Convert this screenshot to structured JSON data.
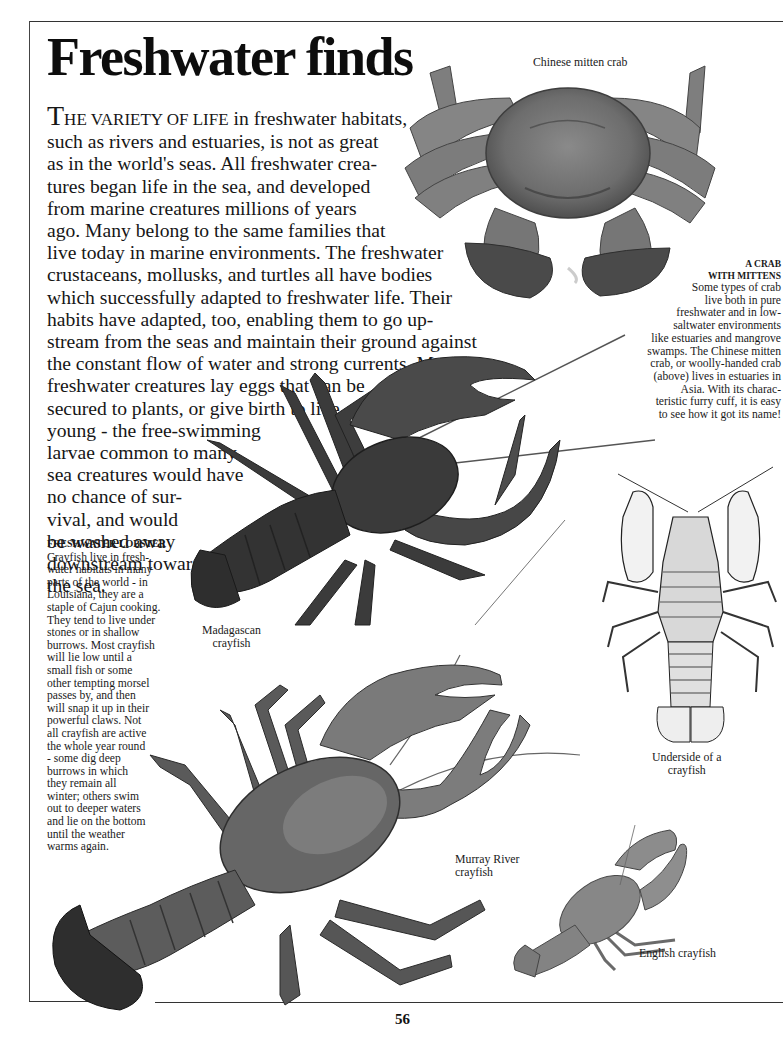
{
  "page": {
    "title": "Freshwater finds",
    "page_number": "56"
  },
  "intro": {
    "dropcap": "T",
    "smallcaps_lead": "HE VARIETY OF LIFE",
    "lines": [
      " in freshwater habitats,",
      "such as rivers and estuaries, is not as great",
      "as in the world's seas. All freshwater crea-",
      "tures began life in the sea, and developed",
      "from marine creatures millions of years",
      "ago.  Many belong to the same families that",
      "live today in marine environments. The freshwater",
      "crustaceans, mollusks, and turtles all have bodies",
      "which successfully adapted to freshwater life. Their",
      "habits have adapted, too, enabling them to go up-",
      "stream from the seas and maintain their ground against",
      "the constant flow of water and strong currents. Many",
      "freshwater creatures lay eggs that can be",
      "secured to plants, or give birth to live",
      "young - the  free-swimming",
      "larvae common to many",
      "sea creatures would have",
      "no chance of sur-",
      "vival, and would",
      "be washed away",
      "downstream toward",
      "the sea."
    ]
  },
  "sidebar_caption": {
    "heading": "FRESHWATER LOBSTER",
    "lines": [
      "Crayfish live in fresh-",
      "water habitats in many",
      "parts of the world - in",
      "Louisiana, they are a",
      "staple of Cajun cooking.",
      "They tend to live under",
      "stones or in shallow",
      "burrows.  Most crayfish",
      "will lie low until a",
      "small fish or some",
      "other tempting morsel",
      "passes by,  and then",
      "will snap it up in their",
      "powerful claws. Not",
      "all crayfish are active",
      "the whole year round",
      "- some dig deep",
      "burrows in which",
      "they remain all",
      "winter; others swim",
      "out to deeper waters",
      "and lie on the bottom",
      "until the weather",
      "warms again."
    ]
  },
  "crab_caption": {
    "heading_lines": [
      "A CRAB",
      "WITH MITTENS"
    ],
    "lines": [
      "Some types of crab",
      "live both in pure",
      "freshwater and in low-",
      "saltwater environments",
      "like estuaries and mangrove",
      "swamps.  The Chinese mitten",
      "crab, or woolly-handed crab",
      "(above) lives in estuaries in",
      "Asia.  With its charac-",
      "teristic furry cuff, it is easy",
      "to see how it got its name!"
    ]
  },
  "figures": {
    "chinese_mitten_crab": {
      "label": "Chinese mitten crab"
    },
    "madagascan_crayfish": {
      "label_lines": [
        "Madagascan",
        "crayfish"
      ]
    },
    "underside_crayfish": {
      "label_lines": [
        "Underside of a",
        "crayfish"
      ]
    },
    "murray_river_crayfish": {
      "label_lines": [
        "Murray River",
        "crayfish"
      ]
    },
    "english_crayfish": {
      "label": "English  crayfish"
    }
  },
  "colors": {
    "frame_line": "#333333",
    "text": "#161616",
    "crab_shell": "#7a7a7a",
    "madagascan_body": "#3a3a3a",
    "murray_body": "#6b6b6b",
    "english_body": "#8a8a8a"
  }
}
